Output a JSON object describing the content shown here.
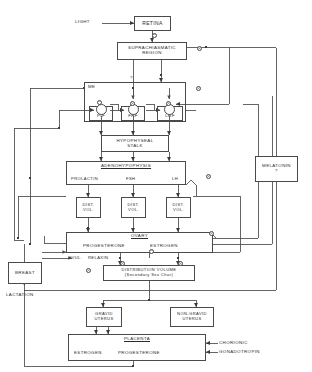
{
  "diagram": {
    "stroke_color": "#4a4a4a",
    "text_color": "#2b2b2b",
    "background": "#ffffff"
  },
  "inputs": {
    "light": "LIGHT"
  },
  "blocks": {
    "retina": "RETINA",
    "suprachiasmatic_line1": "SUPRACHIASMATIC",
    "suprachiasmatic_line2": "REGION",
    "me": "ME",
    "pif": "PIF",
    "frf": "FRF",
    "lrf": "LRF",
    "hypophyseal_line1": "HYPOPHYSEAL",
    "hypophyseal_line2": "STALK",
    "adenohypophysis": "ADENOHYPOPHYSIS",
    "prolactin": "PROLACTIN",
    "fsh": "FSH",
    "lh": "LH",
    "dist_vol_1_line1": "DIST.",
    "dist_vol_1_line2": "VOL.",
    "dist_vol_2_line1": "DIST.",
    "dist_vol_2_line2": "VOL.",
    "dist_vol_3_line1": "DIST.",
    "dist_vol_3_line2": "VOL.",
    "ovary": "OVARY",
    "progesterone": "PROGESTERONE",
    "estrogen": "ESTROGEN",
    "ovul": "OVUL.",
    "relaxin": "RELAXIN",
    "melatonin": "MELATONIN",
    "melatonin_query": "?",
    "breast": "BREAST",
    "lactation": "LACTATION",
    "distribution_volume_line1": "DISTRIBUTION  VOLUME",
    "distribution_volume_line2": "(Secondary Sex Char)",
    "gravid_uterus_line1": "GRAVID",
    "gravid_uterus_line2": "UTERUS",
    "non_gravid_uterus_line1": "NON-GRAVID",
    "non_gravid_uterus_line2": "UTERUS",
    "placenta": "PLACENTA",
    "placenta_estrogen": "ESTROGEN",
    "placenta_progesterone": "PROGESTERONE",
    "chorionic": "CHORIONIC",
    "gonadotropin": "GONADOTROPIN"
  },
  "annotations": {
    "question_mark_suprachiasmatic": "?",
    "signs": [
      {
        "id": "s1",
        "symbol": "⊖",
        "x": 152,
        "y": 33
      },
      {
        "id": "s2",
        "symbol": "⊕",
        "x": 197,
        "y": 46
      },
      {
        "id": "s3",
        "symbol": "⊕",
        "x": 196,
        "y": 86
      },
      {
        "id": "s4",
        "symbol": "⊖",
        "x": 97,
        "y": 100
      },
      {
        "id": "s5",
        "symbol": "⊕",
        "x": 130,
        "y": 101
      },
      {
        "id": "s6",
        "symbol": "⊕",
        "x": 166,
        "y": 101
      },
      {
        "id": "s7",
        "symbol": "⊕",
        "x": 206,
        "y": 174
      },
      {
        "id": "s8",
        "symbol": "⊕",
        "x": 209,
        "y": 231
      },
      {
        "id": "s9",
        "symbol": "⊖",
        "x": 149,
        "y": 249
      },
      {
        "id": "s10",
        "symbol": "⊕",
        "x": 120,
        "y": 261
      },
      {
        "id": "s11",
        "symbol": "⊕",
        "x": 178,
        "y": 261
      },
      {
        "id": "s12",
        "symbol": "⊕",
        "x": 86,
        "y": 268
      }
    ]
  }
}
